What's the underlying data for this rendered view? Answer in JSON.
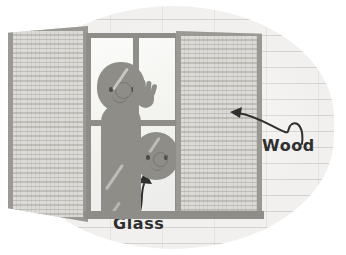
{
  "illustration": {
    "title": "Open window with wooden louvered shutters and child waving through glass",
    "scene_description": "A child waves from behind a four-pane window; a second smaller child peeks from the lower right pane. Two louvered wooden shutters flank the window against a plank wall.",
    "palette": {
      "wall": "#f1f0ee",
      "wall_line": "#a8a6a2",
      "frame": "#8e8d88",
      "shutter_frame": "#9a9994",
      "shutter_slat_light": "#dcdbd7",
      "shutter_slat_dark": "#bfbeb9",
      "glass": "#f7f7f5",
      "figure": "#8e8d88",
      "feature_stroke": "#76756f",
      "label_text": "#2f2f2f"
    },
    "parts": {
      "left_shutter": "louvered wood shutter, open outward",
      "right_shutter": "louvered wood shutter, open outward",
      "window_frame": "four-pane glass window",
      "sill": "window sill ledge",
      "figure_primary": "child waving",
      "figure_secondary": "smaller child head"
    }
  },
  "annotations": [
    {
      "id": "wood",
      "label": "Wood",
      "points_to": "right-shutter",
      "arrow_direction": "left"
    },
    {
      "id": "glass",
      "label": "Glass",
      "points_to": "lower-right-window-pane",
      "arrow_direction": "up"
    }
  ]
}
